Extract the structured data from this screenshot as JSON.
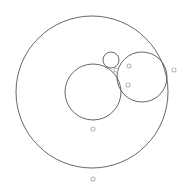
{
  "diagram": {
    "type": "tangent-circles",
    "circles": [
      {
        "id": "outer",
        "cx": 92,
        "cy": 92,
        "r": 76
      },
      {
        "id": "inner-left",
        "cx": 93,
        "cy": 92,
        "r": 28
      },
      {
        "id": "inner-right",
        "cx": 142,
        "cy": 77,
        "r": 25
      },
      {
        "id": "small-top",
        "cx": 111,
        "cy": 60,
        "r": 8
      }
    ],
    "points": [
      {
        "id": "p1",
        "x": 116,
        "y": 70
      },
      {
        "id": "p2",
        "x": 129,
        "y": 66
      },
      {
        "id": "p3",
        "x": 128,
        "y": 85
      },
      {
        "id": "p4",
        "x": 174,
        "y": 70
      },
      {
        "id": "p5",
        "x": 93,
        "y": 129
      },
      {
        "id": "p6",
        "x": 93,
        "y": 179
      }
    ],
    "colors": {
      "stroke": "#555555",
      "point": "#bdbdbd",
      "background": "#ffffff"
    }
  }
}
